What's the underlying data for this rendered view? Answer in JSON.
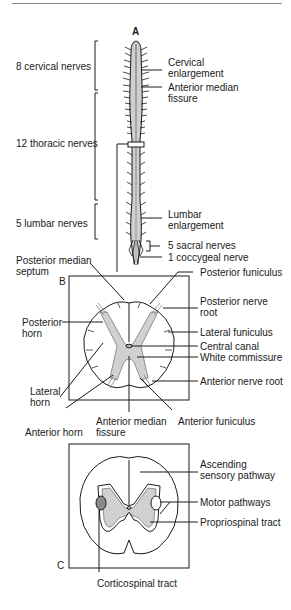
{
  "figure": {
    "panel_a_letter": "A",
    "panel_b_letter": "B",
    "panel_c_letter": "C",
    "panel_a": {
      "left_labels": {
        "cervical": "8 cervical nerves",
        "thoracic": "12 thoracic nerves",
        "lumbar": "5 lumbar nerves"
      },
      "right_labels": {
        "cervical_enlargement": "Cervical enlargement",
        "anterior_median_fissure": "Anterior median fissure",
        "lumbar_enlargement": "Lumbar enlargement",
        "sacral": "5 sacral nerves",
        "coccygeal": "1 coccygeal nerve"
      }
    },
    "panel_b": {
      "posterior_median_septum": "Posterior median septum",
      "posterior_horn": "Posterior horn",
      "lateral_horn": "Lateral horn",
      "anterior_horn": "Anterior horn",
      "anterior_median_fissure": "Anterior median fissure",
      "anterior_funiculus": "Anterior funiculus",
      "posterior_funiculus": "Posterior funiculus",
      "posterior_nerve_root": "Posterior nerve root",
      "lateral_funiculus": "Lateral funiculus",
      "central_canal": "Central canal",
      "white_commissure": "White commissure",
      "anterior_nerve_root": "Anterior nerve root"
    },
    "panel_c": {
      "ascending_sensory": "Ascending sensory pathway",
      "motor_pathways": "Motor pathways",
      "propriospinal": "Propriospinal tract",
      "corticospinal": "Corticospinal tract"
    },
    "colors": {
      "line": "#1a1a1a",
      "gray_matter": "#d4d4d4",
      "corticospinal_fill": "#8a8a8a"
    }
  }
}
